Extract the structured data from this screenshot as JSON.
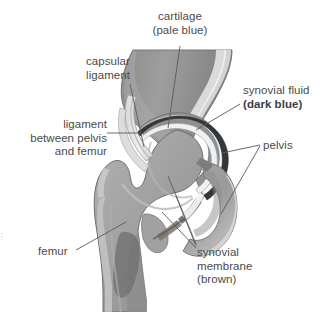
{
  "diagram": {
    "background_color": "#ffffff",
    "colors": {
      "bone": "#9b9b9b",
      "bone_light": "#bcbcbc",
      "bone_dark": "#7e7e7e",
      "cartilage_pale_blue": "#f2f4f6",
      "synovial_fluid_dark_blue": "#2f3336",
      "synovial_membrane_brown": "#6f6a64",
      "outline": "#6e6e6e",
      "label_text": "#4a4a4a",
      "leader_line": "#5a5a5a"
    },
    "labels": [
      {
        "id": "cartilage",
        "name": "cartilage",
        "line1": "cartilage",
        "line2": "(pale blue)",
        "line2_bold": false,
        "align": "center",
        "position": {
          "x": 180,
          "y": 10
        }
      },
      {
        "id": "capsular-ligament",
        "name": "capsular ligament",
        "line1": "capsular",
        "line2": "ligament",
        "line2_bold": false,
        "align": "center",
        "position": {
          "x": 110,
          "y": 55
        }
      },
      {
        "id": "synovial-fluid",
        "name": "synovial fluid",
        "line1": "synovial fluid",
        "line2": "(dark blue)",
        "line2_bold": true,
        "align": "left",
        "position": {
          "x": 243,
          "y": 84
        }
      },
      {
        "id": "ligament-pelvis-femur",
        "name": "ligament between pelvis and femur",
        "line1": "ligament",
        "line2": "between pelvis",
        "line3": "and femur",
        "align": "right",
        "position": {
          "x": 10,
          "y": 118
        }
      },
      {
        "id": "pelvis",
        "name": "pelvis",
        "line1": "pelvis",
        "align": "left",
        "position": {
          "x": 263,
          "y": 140
        }
      },
      {
        "id": "femur",
        "name": "femur",
        "line1": "femur",
        "align": "left",
        "position": {
          "x": 38,
          "y": 247
        }
      },
      {
        "id": "synovial-membrane",
        "name": "synovial membrane",
        "line1": "synovial",
        "line2": "membrane",
        "line3": "(brown)",
        "align": "left",
        "position": {
          "x": 197,
          "y": 247
        }
      }
    ],
    "structures": [
      {
        "id": "femur",
        "name": "femur",
        "description": "thigh bone with head, neck, greater trochanter and shaft"
      },
      {
        "id": "pelvis",
        "name": "pelvis",
        "description": "acetabulum socket and ischium"
      },
      {
        "id": "cartilage",
        "name": "articular cartilage",
        "description": "pale blue lining on joint surfaces"
      },
      {
        "id": "synovial-fluid",
        "name": "synovial fluid",
        "description": "dark blue joint space fluid"
      },
      {
        "id": "synovial-membrane",
        "name": "synovial membrane",
        "description": "brown lining of joint capsule"
      },
      {
        "id": "capsular-ligament",
        "name": "capsular ligament",
        "description": "fibrous capsule enclosing the joint"
      },
      {
        "id": "ligament-pelvis-femur",
        "name": "ligament between pelvis and femur",
        "description": "iliofemoral ligament band"
      }
    ]
  }
}
